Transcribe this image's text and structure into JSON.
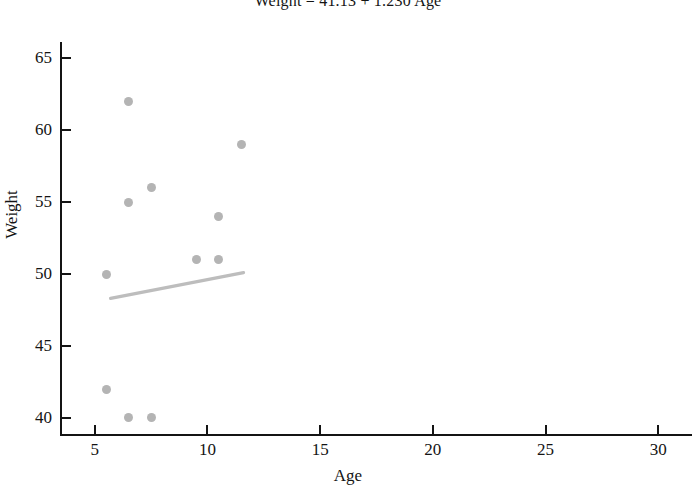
{
  "chart_data": {
    "type": "scatter",
    "title": "Weight = 41.13 + 1.230 Age",
    "xlabel": "Age",
    "ylabel": "Weight",
    "xlim": [
      3.5,
      31.5
    ],
    "ylim": [
      38.8,
      66.0
    ],
    "xticks": [
      5,
      10,
      15,
      20,
      25,
      30
    ],
    "yticks": [
      40,
      45,
      50,
      55,
      60,
      65
    ],
    "grid": false,
    "legend": "none",
    "point_color": "#b4b4b4",
    "line_color": "#bdbdbd",
    "axis_color": "#141414",
    "points": [
      {
        "x": 6.5,
        "y": 62
      },
      {
        "x": 11.5,
        "y": 59
      },
      {
        "x": 7.5,
        "y": 56
      },
      {
        "x": 6.5,
        "y": 55
      },
      {
        "x": 10.5,
        "y": 54
      },
      {
        "x": 9.5,
        "y": 51
      },
      {
        "x": 10.5,
        "y": 51
      },
      {
        "x": 5.5,
        "y": 50
      },
      {
        "x": 5.5,
        "y": 42
      },
      {
        "x": 6.5,
        "y": 40
      },
      {
        "x": 7.5,
        "y": 40
      }
    ],
    "fit_line": {
      "equation": "Weight = 41.13 + 1.230 Age",
      "intercept": 41.13,
      "slope": 1.23,
      "x_start": 5.7,
      "x_end": 11.6,
      "y_start": 48.3,
      "y_end": 50.1
    }
  }
}
